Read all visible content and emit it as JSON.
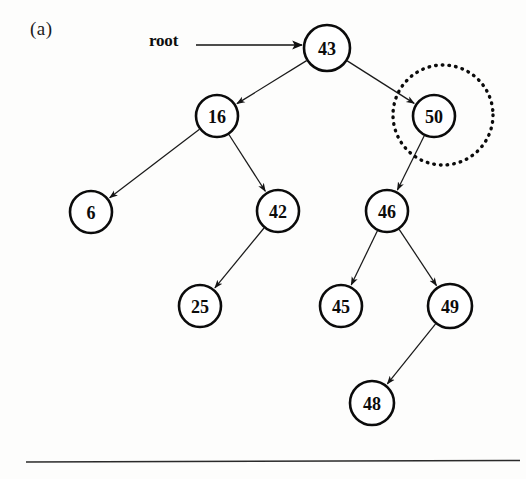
{
  "figure": {
    "panel_label": "(a)",
    "root_label": "root",
    "background_color": "#fdfdfc",
    "ink_color": "#0b0b0b",
    "highlight_color": "#0b0b0b"
  },
  "chart_data": {
    "type": "diagram",
    "title": "(a)",
    "diagram_kind": "binary-search-tree",
    "nodes": [
      {
        "id": "n43",
        "label": "43",
        "x": 327,
        "y": 48,
        "r": 23
      },
      {
        "id": "n16",
        "label": "16",
        "x": 217,
        "y": 116,
        "r": 21
      },
      {
        "id": "n50",
        "label": "50",
        "x": 434,
        "y": 116,
        "r": 21
      },
      {
        "id": "n6",
        "label": "6",
        "x": 91,
        "y": 212,
        "r": 21
      },
      {
        "id": "n42",
        "label": "42",
        "x": 278,
        "y": 211,
        "r": 21
      },
      {
        "id": "n46",
        "label": "46",
        "x": 387,
        "y": 211,
        "r": 21
      },
      {
        "id": "n25",
        "label": "25",
        "x": 200,
        "y": 306,
        "r": 21
      },
      {
        "id": "n45",
        "label": "45",
        "x": 341,
        "y": 306,
        "r": 21
      },
      {
        "id": "n49",
        "label": "49",
        "x": 450,
        "y": 306,
        "r": 22
      },
      {
        "id": "n48",
        "label": "48",
        "x": 372,
        "y": 403,
        "r": 22
      }
    ],
    "edges": [
      {
        "from": "n43",
        "to": "n16",
        "arrow": true
      },
      {
        "from": "n43",
        "to": "n50",
        "arrow": true
      },
      {
        "from": "n16",
        "to": "n6",
        "arrow": true
      },
      {
        "from": "n16",
        "to": "n42",
        "arrow": true
      },
      {
        "from": "n42",
        "to": "n25",
        "arrow": true
      },
      {
        "from": "n50",
        "to": "n46",
        "arrow": true
      },
      {
        "from": "n46",
        "to": "n45",
        "arrow": true
      },
      {
        "from": "n46",
        "to": "n49",
        "arrow": true
      },
      {
        "from": "n49",
        "to": "n48",
        "arrow": true
      }
    ],
    "root_pointer": {
      "label": "root",
      "from_x": 196,
      "to_x": 302,
      "y": 45
    },
    "highlight": {
      "target": "n50",
      "cx": 443,
      "cy": 115,
      "r": 50,
      "style": "dotted"
    },
    "separator_rule": {
      "x1": 26,
      "x2": 520,
      "y": 462
    },
    "annotations": [
      "Node 50 is circled with a dotted outline"
    ]
  }
}
